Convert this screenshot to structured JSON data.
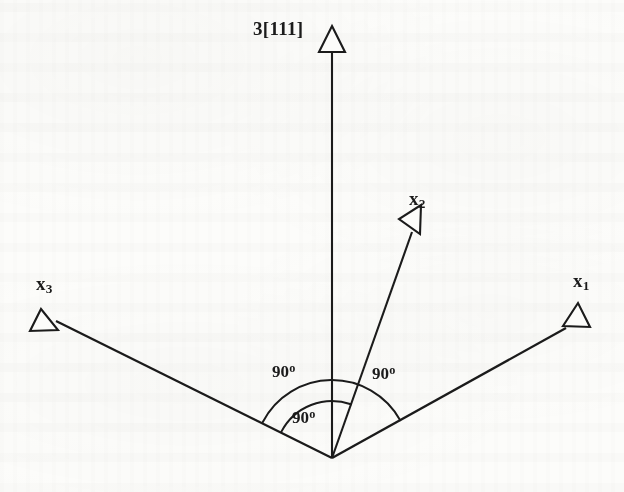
{
  "figure": {
    "kind": "crystallographic-axes-diagram",
    "background_color": "#fcfcfa",
    "ink_color": "#1b1b1b",
    "origin": {
      "x": 332,
      "y": 458
    },
    "labels": {
      "triad_axis": "3[111]",
      "axis_x1": "x",
      "axis_x1_sub": "1",
      "axis_x2": "x",
      "axis_x2_sub": "2",
      "axis_x3": "x",
      "axis_x3_sub": "3",
      "angle_left": "90",
      "angle_right": "90",
      "angle_inner": "90",
      "degree_symbol": "o"
    },
    "vectors": [
      {
        "name": "triad-axis",
        "label": "3[111]",
        "angle_deg": 90,
        "tip": {
          "x": 332,
          "y": 26
        },
        "arrowhead": "hollow-triangle"
      },
      {
        "name": "axis-x1",
        "label": "x1",
        "angle_deg": 29,
        "tip": {
          "x": 578,
          "y": 303
        },
        "arrowhead": "hollow-triangle"
      },
      {
        "name": "axis-x2",
        "label": "x2",
        "angle_deg": 70.5,
        "tip": {
          "x": 421,
          "y": 205
        },
        "arrowhead": "hollow-triangle"
      },
      {
        "name": "axis-x3",
        "label": "x3",
        "angle_deg": 152.5,
        "tip": {
          "x": 41,
          "y": 309
        },
        "arrowhead": "hollow-triangle"
      }
    ],
    "arcs": [
      {
        "name": "outer-arc-x3-to-x1",
        "radius": 78,
        "from_angle_deg": 29,
        "to_angle_deg": 152.5,
        "annotates": "90"
      },
      {
        "name": "inner-arc-x3-to-x2",
        "radius": 57,
        "from_angle_deg": 70.5,
        "to_angle_deg": 152.5,
        "annotates": "90"
      }
    ],
    "angle_annotations": [
      {
        "name": "angle-label-left",
        "text": "90",
        "x": 272,
        "y": 361
      },
      {
        "name": "angle-label-right",
        "text": "90",
        "x": 372,
        "y": 363
      },
      {
        "name": "angle-label-inner",
        "text": "90",
        "x": 292,
        "y": 407
      }
    ]
  }
}
